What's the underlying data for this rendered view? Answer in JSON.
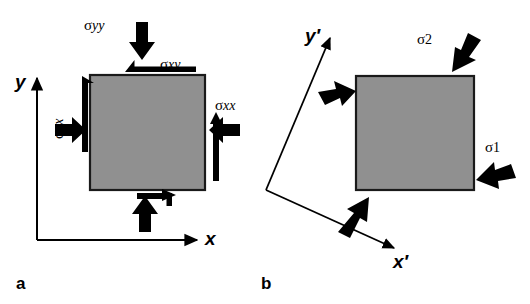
{
  "figure": {
    "width": 530,
    "height": 304,
    "background": "#ffffff",
    "ink": "#000000",
    "block_fill": "#909090",
    "block_stroke": "#1a1a1a"
  },
  "panel_a": {
    "letter": "a",
    "axes": {
      "x_label": "x",
      "y_label": "y"
    },
    "block": {
      "x": 90,
      "y": 75,
      "width": 115,
      "height": 115,
      "fill": "#909090"
    },
    "stresses": [
      {
        "id": "sigma-yy",
        "symbol": "σ",
        "subscript": "yy",
        "kind": "normal",
        "face": "top",
        "direction": "down"
      },
      {
        "id": "sigma-xy",
        "symbol": "σ",
        "subscript": "xy",
        "kind": "shear",
        "face": "top",
        "direction": "left"
      },
      {
        "id": "sigma-yx",
        "symbol": "σ",
        "subscript": "yx",
        "kind": "shear",
        "face": "left",
        "direction": "down"
      },
      {
        "id": "sigma-xx",
        "symbol": "σ",
        "subscript": "xx",
        "kind": "normal",
        "face": "right",
        "direction": "left"
      }
    ]
  },
  "panel_b": {
    "letter": "b",
    "axes": {
      "x_label": "x′",
      "y_label": "y′",
      "rotation_note": "rotated frame"
    },
    "block": {
      "x": 356,
      "y": 76,
      "width": 118,
      "height": 114,
      "fill": "#909090"
    },
    "stresses": [
      {
        "id": "sigma-2",
        "symbol": "σ",
        "subscript": "2",
        "kind": "principal",
        "face": "top",
        "direction": "down-left"
      },
      {
        "id": "sigma-1",
        "symbol": "σ",
        "subscript": "1",
        "kind": "principal",
        "face": "right",
        "direction": "up-left"
      }
    ]
  }
}
